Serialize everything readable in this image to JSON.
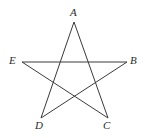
{
  "figure": {
    "name": "pentagram-diagram",
    "background_color": "#ffffff",
    "stroke_color": "#3a3a3a",
    "stroke_width": 1,
    "label_color": "#2b2b2b",
    "width": 145,
    "height": 138
  },
  "labels": {
    "A": "A",
    "B": "B",
    "C": "C",
    "D": "D",
    "E": "E"
  },
  "chart_data": {
    "type": "scatter",
    "title": "",
    "xlabel": "",
    "ylabel": "",
    "points": [
      {
        "name": "A",
        "x": 74,
        "y": 22
      },
      {
        "name": "B",
        "x": 127,
        "y": 62
      },
      {
        "name": "C",
        "x": 108,
        "y": 118
      },
      {
        "name": "D",
        "x": 41,
        "y": 118
      },
      {
        "name": "E",
        "x": 22,
        "y": 62
      }
    ],
    "edges": [
      [
        "A",
        "C"
      ],
      [
        "C",
        "E"
      ],
      [
        "E",
        "B"
      ],
      [
        "B",
        "D"
      ],
      [
        "D",
        "A"
      ]
    ],
    "shape": "pentagram",
    "grid": false,
    "legend": "none"
  }
}
